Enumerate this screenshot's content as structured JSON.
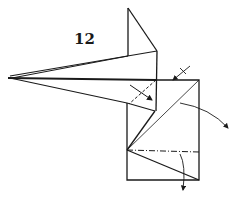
{
  "diagram": {
    "type": "origami-fold-instruction",
    "step_number": "12",
    "elements": [
      {
        "name": "model-outline",
        "kind": "solid-lines"
      },
      {
        "name": "valley-fold-line",
        "kind": "dashed",
        "note": "diagonal near flap junction"
      },
      {
        "name": "mountain-fold-line",
        "kind": "dash-dot",
        "note": "horizontal across lower square"
      },
      {
        "name": "fold-arrow-flap",
        "kind": "arrow"
      },
      {
        "name": "push-arrow-corner",
        "kind": "arrow-with-tick"
      },
      {
        "name": "fold-arrow-right-curved",
        "kind": "curved-arrow"
      },
      {
        "name": "fold-arrow-down",
        "kind": "curved-arrow"
      }
    ],
    "colors": {
      "ink": "#1a1a1a",
      "paper": "#ffffff"
    }
  }
}
